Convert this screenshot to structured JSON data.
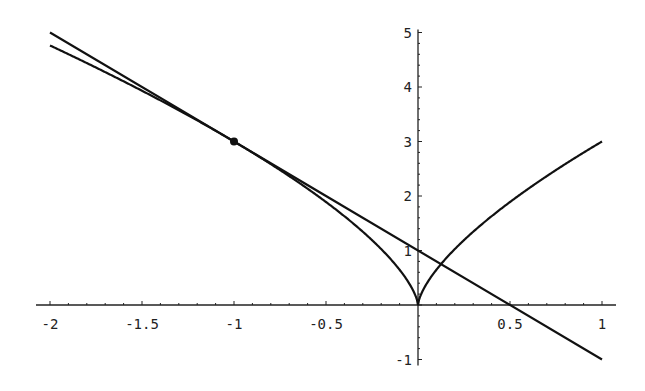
{
  "chart_data": {
    "type": "line",
    "title": "",
    "xlabel": "",
    "ylabel": "",
    "xlim": [
      -2,
      1
    ],
    "ylim": [
      -1,
      5
    ],
    "grid": false,
    "legend": null,
    "x_ticks": [
      -2,
      -1.5,
      -1,
      -0.5,
      0.5,
      1
    ],
    "x_tick_labels": [
      "-2",
      "-1.5",
      "-1",
      "-0.5",
      "0.5",
      "1"
    ],
    "y_ticks": [
      -1,
      1,
      2,
      3,
      4,
      5
    ],
    "y_tick_labels": [
      "-1",
      "1",
      "2",
      "3",
      "4",
      "5"
    ],
    "series": [
      {
        "name": "curve y = 3|x|^(2/3)",
        "x": [
          -2,
          -1.75,
          -1.5,
          -1.25,
          -1,
          -0.75,
          -0.5,
          -0.25,
          -0.1,
          0,
          0.1,
          0.25,
          0.5,
          0.75,
          1
        ],
        "y": [
          4.76,
          4.35,
          3.93,
          3.48,
          3.0,
          2.48,
          1.89,
          1.19,
          0.65,
          0,
          0.65,
          1.19,
          1.89,
          2.48,
          3.0
        ]
      },
      {
        "name": "tangent line y = -2x + 1",
        "x": [
          -2,
          1
        ],
        "y": [
          5,
          -1
        ]
      }
    ],
    "points": [
      {
        "name": "tangent point",
        "x": -1,
        "y": 3
      }
    ]
  },
  "plot": {
    "origin_px": [
      418,
      305
    ],
    "x_scale_px_per_unit": 184,
    "y_scale_px_per_unit": 54.5,
    "line_color": "#111111"
  }
}
